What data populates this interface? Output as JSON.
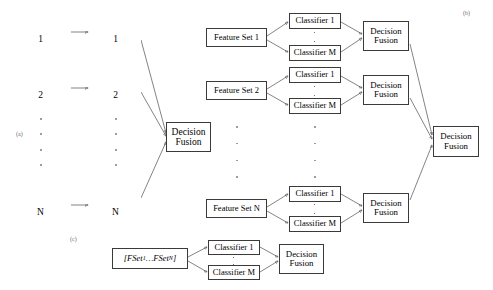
{
  "figure": {
    "panels": [
      {
        "id": "a",
        "label": "(a)"
      },
      {
        "id": "b",
        "label": "(b)"
      },
      {
        "id": "c",
        "label": "(c)"
      }
    ]
  },
  "panel_a": {
    "label": "(a)",
    "feature_sets": [
      {
        "line1": "Feature Set",
        "line2": "1"
      },
      {
        "line1": "Feature Set",
        "line2": "2"
      },
      {
        "line1": "Feature Set",
        "line2": "N"
      }
    ],
    "classifiers": [
      {
        "line1": "Classifier",
        "line2": "1"
      },
      {
        "line1": "Classifier",
        "line2": "2"
      },
      {
        "line1": "Classifier",
        "line2": "N"
      }
    ],
    "fusion": {
      "line1": "Decision",
      "line2": "Fusion"
    }
  },
  "panel_b": {
    "label": "(b)",
    "rows": [
      {
        "feature_set": "Feature Set 1",
        "classifier_first": "Classifier 1",
        "classifier_last": "Classifier M",
        "fusion_line1": "Decision",
        "fusion_line2": "Fusion"
      },
      {
        "feature_set": "Feature Set 2",
        "classifier_first": "Classifier 1",
        "classifier_last": "Classifier M",
        "fusion_line1": "Decision",
        "fusion_line2": "Fusion"
      },
      {
        "feature_set": "Feature Set N",
        "classifier_first": "Classifier 1",
        "classifier_last": "Classifier M",
        "fusion_line1": "Decision",
        "fusion_line2": "Fusion"
      }
    ],
    "final_fusion": {
      "line1": "Decision",
      "line2": "Fusion"
    }
  },
  "panel_c": {
    "label": "(c)",
    "feature_vector": {
      "open_bracket": "[",
      "term1": "FSet",
      "sub1": "1",
      "ellipsis": " … ",
      "term2": "FSet",
      "sub2": "N",
      "close_bracket": "]"
    },
    "classifier_first": "Classifier 1",
    "classifier_last": "Classifier M",
    "fusion": {
      "line1": "Decision",
      "line2": "Fusion"
    }
  },
  "colors": {
    "box_border": "#3a3a3a",
    "wire": "#4f4f4f",
    "text": "#000000",
    "panel_label": "#6a6a6a",
    "background": "#ffffff"
  }
}
